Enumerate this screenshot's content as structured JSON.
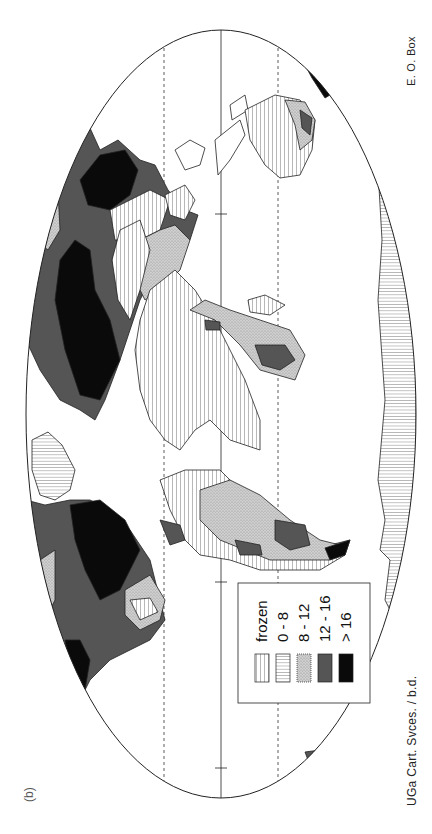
{
  "figure": {
    "label": "(b)",
    "orientation": "rotated 90 degrees clockwise",
    "projection": "elliptical world map"
  },
  "credits": {
    "left": "UGa Cart. Svces. / b.d.",
    "right": "E. O. Box"
  },
  "legend": {
    "items": [
      {
        "label": "frozen",
        "pattern": "vertical-hatch",
        "color": "#ffffff"
      },
      {
        "label": "0 - 8",
        "pattern": "horizontal-hatch",
        "color": "#ffffff"
      },
      {
        "label": "8 - 12",
        "pattern": "stipple",
        "color": "#c8c8c8"
      },
      {
        "label": "12 - 16",
        "pattern": "solid",
        "color": "#555555"
      },
      {
        "label": "> 16",
        "pattern": "solid",
        "color": "#0a0a0a"
      }
    ]
  },
  "colors": {
    "outline": "#222222",
    "dark_gray": "#555555",
    "black": "#0a0a0a",
    "light_stipple": "#c8c8c8",
    "background": "#ffffff"
  },
  "regions": [
    {
      "name": "North America",
      "classes": [
        "12 - 16",
        "> 16",
        "8 - 12",
        "frozen"
      ]
    },
    {
      "name": "South America",
      "classes": [
        "12 - 16",
        "> 16",
        "8 - 12"
      ]
    },
    {
      "name": "Greenland",
      "classes": [
        "0 - 8"
      ]
    },
    {
      "name": "Eurasia",
      "classes": [
        "frozen",
        "8 - 12",
        "12 - 16",
        "> 16"
      ]
    },
    {
      "name": "Africa",
      "classes": [
        "8 - 12",
        "frozen",
        "12 - 16"
      ]
    },
    {
      "name": "Australia",
      "classes": [
        "frozen",
        "8 - 12",
        "12 - 16"
      ]
    },
    {
      "name": "Antarctica",
      "classes": [
        "0 - 8"
      ]
    }
  ]
}
